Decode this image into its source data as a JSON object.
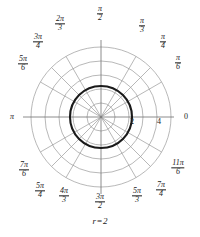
{
  "figure": {
    "caption_var": "r",
    "caption_eq": "=",
    "caption_value": "2",
    "axis_label_left": "π",
    "axis_label_right": "0"
  },
  "angle_labels": [
    {
      "name": "angle-label-pi-over-2",
      "num": "π",
      "den": "2",
      "x": 100,
      "y": 14
    },
    {
      "name": "angle-label-pi-over-3",
      "num": "π",
      "den": "3",
      "x": 142,
      "y": 26
    },
    {
      "name": "angle-label-pi-over-4",
      "num": "π",
      "den": "4",
      "x": 163,
      "y": 42
    },
    {
      "name": "angle-label-pi-over-6",
      "num": "π",
      "den": "6",
      "x": 178,
      "y": 63
    },
    {
      "name": "angle-label-2pi-over-3",
      "num": "2π",
      "den": "3",
      "x": 60,
      "y": 24
    },
    {
      "name": "angle-label-3pi-over-4",
      "num": "3π",
      "den": "4",
      "x": 38,
      "y": 42
    },
    {
      "name": "angle-label-5pi-over-6",
      "num": "5π",
      "den": "6",
      "x": 23,
      "y": 64
    },
    {
      "name": "angle-label-7pi-over-6",
      "num": "7π",
      "den": "6",
      "x": 24,
      "y": 170
    },
    {
      "name": "angle-label-5pi-over-4",
      "num": "5π",
      "den": "4",
      "x": 40,
      "y": 191
    },
    {
      "name": "angle-label-4pi-over-3",
      "num": "4π",
      "den": "3",
      "x": 64,
      "y": 196
    },
    {
      "name": "angle-label-3pi-over-2",
      "num": "3π",
      "den": "2",
      "x": 100,
      "y": 202
    },
    {
      "name": "angle-label-5pi-over-3",
      "num": "5π",
      "den": "3",
      "x": 137,
      "y": 196
    },
    {
      "name": "angle-label-7pi-over-4",
      "num": "7π",
      "den": "4",
      "x": 161,
      "y": 190
    },
    {
      "name": "angle-label-11pi-over-6",
      "num": "11π",
      "den": "6",
      "x": 178,
      "y": 168
    }
  ],
  "radial_ticks": [
    {
      "name": "radial-tick-2",
      "label": "2",
      "x": 132,
      "y": 122
    },
    {
      "name": "radial-tick-4",
      "label": "4",
      "x": 159,
      "y": 122
    }
  ],
  "colors": {
    "grid": "#9a9a9a",
    "axis": "#6e6e6e",
    "curve": "#1a1a1a",
    "text": "#1a1a1a",
    "background": "#ffffff"
  },
  "chart_data": {
    "type": "line",
    "coordinate_system": "polar",
    "title": "",
    "subtitle": "",
    "caption": "r = 2",
    "equation": "r = 2",
    "series": [
      {
        "name": "r = 2",
        "kind": "circle",
        "r_constant": 2,
        "theta_range": [
          0,
          6.283185307179586
        ],
        "emphasis": "bold",
        "color": "#1a1a1a",
        "linewidth": 2.1
      }
    ],
    "r_axis": {
      "label": "",
      "rlim": [
        0,
        5
      ],
      "grid_circles": [
        1,
        2,
        3,
        4,
        5
      ],
      "tick_values": [
        2,
        4
      ],
      "tick_labels": [
        "2",
        "4"
      ],
      "tick_angle_deg": 0
    },
    "theta_axis": {
      "label": "",
      "grid_spokes_deg": [
        0,
        30,
        45,
        60,
        90,
        120,
        135,
        150,
        180,
        210,
        225,
        240,
        270,
        300,
        315,
        330
      ],
      "tick_labels": [
        "0",
        "π/6",
        "π/4",
        "π/3",
        "π/2",
        "2π/3",
        "3π/4",
        "5π/6",
        "π",
        "7π/6",
        "5π/4",
        "4π/3",
        "3π/2",
        "5π/3",
        "7π/4",
        "11π/6"
      ],
      "direction": "counterclockwise",
      "zero_location": "E"
    },
    "grid": true,
    "legend": false,
    "legend_position": "none"
  }
}
